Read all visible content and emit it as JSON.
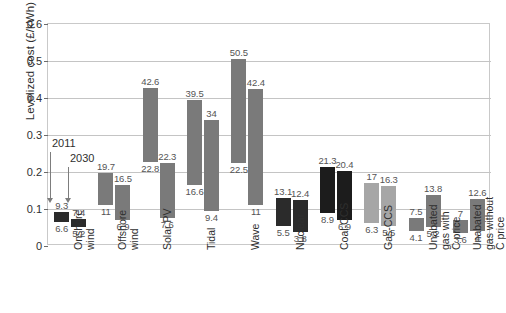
{
  "chart_data": {
    "type": "bar",
    "subtype": "floating-range-bars",
    "title": "",
    "xlabel": "",
    "ylabel": "Levelized cost (£/kWh)",
    "ylim": [
      0,
      0.6
    ],
    "yticks": [
      "0",
      "0.1",
      "0.2",
      "0.3",
      "0.4",
      "0.5",
      "0.6"
    ],
    "ytick_values": [
      0,
      0.1,
      0.2,
      0.3,
      0.4,
      0.5,
      0.6
    ],
    "grid": true,
    "legend_position": "none",
    "value_units": "p/kWh (labels); axis in £/kWh",
    "annotations": [
      {
        "text": "2011",
        "points_to": "first bar of each group"
      },
      {
        "text": "2030",
        "points_to": "second bar of each group"
      }
    ],
    "series": [
      {
        "name": "2011",
        "color": "#7a7a7a"
      },
      {
        "name": "2030",
        "color": "#7a7a7a"
      }
    ],
    "categories": [
      "Onshore\nwind",
      "Offshore\nwind",
      "Solar PV",
      "Tidal",
      "Wave",
      "Nuclear",
      "Coal-CCS",
      "Gas-CCS",
      "Unabated\ngas with\nC price",
      "Unabated\ngas without\nC price"
    ],
    "groups": [
      {
        "category": "Onshore\nwind",
        "color": "#2b2b2b",
        "bars": [
          {
            "series": "2011",
            "low": 6.6,
            "high": 9.3,
            "low_label": "6.6",
            "high_label": "9.3"
          },
          {
            "series": "2030",
            "low": 5.2,
            "high": 7.4,
            "low_label": "5.2",
            "high_label": "7.4"
          }
        ]
      },
      {
        "category": "Offshore\nwind",
        "color": "#7a7a7a",
        "bars": [
          {
            "series": "2011",
            "low": 11,
            "high": 19.7,
            "low_label": "11",
            "high_label": "19.7"
          },
          {
            "series": "2030",
            "low": 6.9,
            "high": 16.5,
            "low_label": "6.9",
            "high_label": "16.5"
          }
        ]
      },
      {
        "category": "Solar PV",
        "color": "#7a7a7a",
        "bars": [
          {
            "series": "2011",
            "low": 22.8,
            "high": 42.6,
            "low_label": "22.8",
            "high_label": "42.6"
          },
          {
            "series": "2030",
            "low": 7.6,
            "high": 22.3,
            "low_label": "7.6",
            "high_label": "22.3"
          }
        ]
      },
      {
        "category": "Tidal",
        "color": "#7a7a7a",
        "bars": [
          {
            "series": "2011",
            "low": 16.6,
            "high": 39.5,
            "low_label": "16.6",
            "high_label": "39.5"
          },
          {
            "series": "2030",
            "low": 9.4,
            "high": 34,
            "low_label": "9.4",
            "high_label": "34"
          }
        ]
      },
      {
        "category": "Wave",
        "color": "#7a7a7a",
        "bars": [
          {
            "series": "2011",
            "low": 22.5,
            "high": 50.5,
            "low_label": "22.5",
            "high_label": "50.5"
          },
          {
            "series": "2030",
            "low": 11,
            "high": 42.4,
            "low_label": "11",
            "high_label": "42.4"
          }
        ]
      },
      {
        "category": "Nuclear",
        "color": "#2b2b2b",
        "bars": [
          {
            "series": "2011",
            "low": 5.5,
            "high": 13.1,
            "low_label": "5.5",
            "high_label": "13.1"
          },
          {
            "series": "2030",
            "low": 3.8,
            "high": 12.4,
            "low_label": "3.8",
            "high_label": "12.4"
          }
        ]
      },
      {
        "category": "Coal-CCS",
        "color": "#1c1c1c",
        "bars": [
          {
            "series": "2011",
            "low": 8.9,
            "high": 21.3,
            "low_label": "8.9",
            "high_label": "21.3"
          },
          {
            "series": "2030",
            "low": 6.9,
            "high": 20.4,
            "low_label": "6.9",
            "high_label": "20.4"
          }
        ]
      },
      {
        "category": "Gas-CCS",
        "color": "#a6a6a6",
        "bars": [
          {
            "series": "2011",
            "low": 6.3,
            "high": 17,
            "low_label": "6.3",
            "high_label": "17"
          },
          {
            "series": "2030",
            "low": 5.5,
            "high": 16.3,
            "low_label": "5.5",
            "high_label": "16.3"
          }
        ]
      },
      {
        "category": "Unabated\ngas with\nC price",
        "color": "#7a7a7a",
        "bars": [
          {
            "series": "2011",
            "low": 4.1,
            "high": 7.5,
            "low_label": "4.1",
            "high_label": "7.5"
          },
          {
            "series": "2030",
            "low": 5.2,
            "high": 13.8,
            "low_label": "5.2",
            "high_label": "13.8"
          }
        ]
      },
      {
        "category": "Unabated\ngas without\nC price",
        "color": "#7a7a7a",
        "bars": [
          {
            "series": "2011",
            "low": 3.6,
            "high": 7,
            "low_label": "3.6",
            "high_label": "7"
          },
          {
            "series": "2030",
            "low": 4,
            "high": 12.6,
            "low_label": "4",
            "high_label": "12.6"
          }
        ]
      }
    ]
  },
  "axis": {
    "y_title": "Levelized cost (£/kWh)"
  },
  "annotations": {
    "label_2011": "2011",
    "label_2030": "2030"
  }
}
